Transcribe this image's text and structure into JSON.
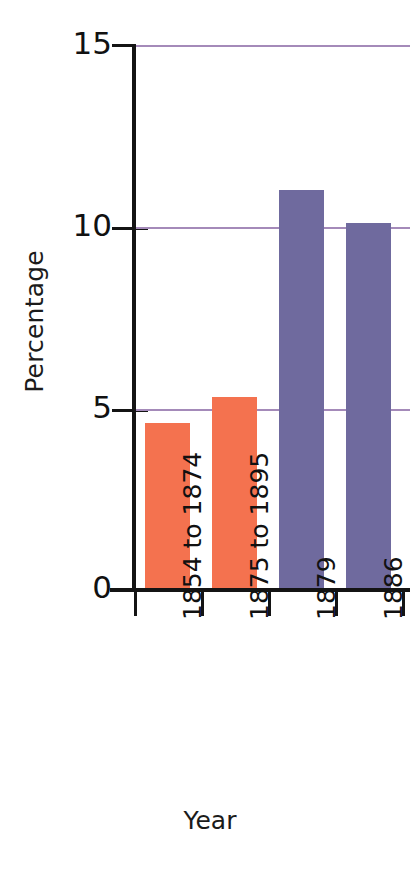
{
  "chart_data": {
    "type": "bar",
    "title": "",
    "xlabel": "Year",
    "ylabel": "Percentage",
    "categories": [
      "1854 to 1874",
      "1875 to 1895",
      "1879",
      "1886"
    ],
    "values": [
      4.6,
      5.3,
      11.0,
      10.1
    ],
    "bar_colors": [
      "#f4724f",
      "#f4724f",
      "#6f6a9e",
      "#6f6a9e"
    ],
    "ylim": [
      0,
      15
    ],
    "yticks": [
      0,
      5,
      10,
      15
    ],
    "ytick_labels": [
      "0",
      "5",
      "10",
      "15"
    ],
    "grid": "horizontal",
    "gridline_color": "#a48ab9",
    "legend": "none",
    "background": "#ffffff",
    "axis_color": "#141414"
  },
  "axes": {
    "y_title": "Percentage",
    "x_title": "Year",
    "y_tick_labels": [
      "15",
      "10",
      "5",
      "0"
    ],
    "x_tick_labels": [
      "1854 to 1874",
      "1875 to 1895",
      "1879",
      "1886"
    ]
  }
}
